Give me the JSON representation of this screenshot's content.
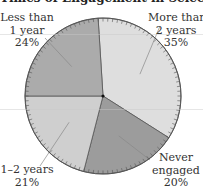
{
  "chart_data": {
    "type": "pie",
    "title": "Times of Engagement in Selected Occupations",
    "categories": [
      "More than 2 years",
      "Never engaged",
      "1–2 years",
      "Less than 1 year"
    ],
    "values": [
      35,
      20,
      21,
      24
    ],
    "unit": "%",
    "start_angle_deg": 356.4,
    "direction": "clockwise",
    "colors": [
      "#dedede",
      "#9c9c9c",
      "#cfcfcf",
      "#ababab"
    ],
    "labels": [
      {
        "line1": "More than",
        "line2": "2 years",
        "pct": "35%"
      },
      {
        "line1": "Never",
        "line2": "engaged",
        "pct": "20%"
      },
      {
        "line1": "1–2 years",
        "line2": "",
        "pct": "21%"
      },
      {
        "line1": "Less than",
        "line2": "1 year",
        "pct": "24%"
      }
    ]
  }
}
